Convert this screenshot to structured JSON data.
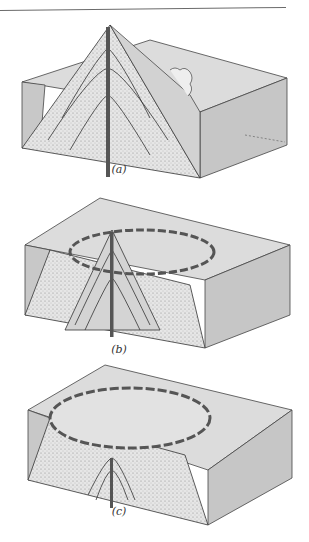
{
  "figure": {
    "panels": [
      {
        "id": "a",
        "label": "(a)",
        "stage": "intact stratovolcano cone cut away to show central conduit and layered strata"
      },
      {
        "id": "b",
        "label": "(b)",
        "stage": "summit collapsed, caldera rim beginning to form around truncated cone"
      },
      {
        "id": "c",
        "label": "(c)",
        "stage": "broad flat caldera floor with remnant conduit and strata below"
      }
    ],
    "colors": {
      "block_top": "#d8d8d8",
      "block_side": "#c4c4c4",
      "block_front": "#bdbdbd",
      "stipple": "#e4e4e4",
      "line": "#2a2a2a",
      "rule": "#6a6a6a"
    }
  }
}
